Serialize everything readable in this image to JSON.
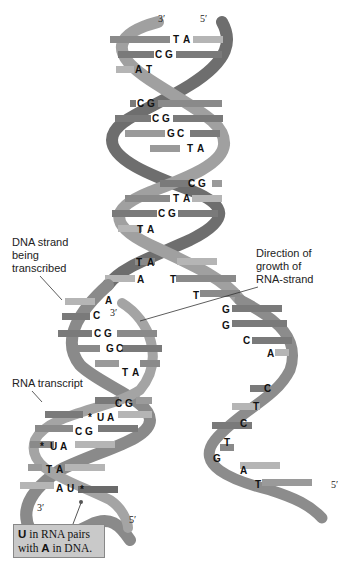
{
  "diagram": {
    "colors": {
      "strand_dark": "#6e6e6e",
      "strand_mid": "#8c8c8c",
      "strand_light": "#a8a8a8",
      "rung_dark": "#7a7a7a",
      "rung_light": "#b2b2b2",
      "callout_bg": "#c9c9c9",
      "text": "#111111"
    },
    "end_labels": {
      "top_left": "3′",
      "top_right": "5′",
      "transcription_3prime": "3′",
      "bottom_left_3prime": "3′",
      "bottom_rna_5prime": "5′",
      "bottom_right_5prime": "5′"
    },
    "labels": {
      "dna_strand_line1": "DNA strand",
      "dna_strand_line2": "being",
      "dna_strand_line3": "transcribed",
      "direction_line1": "Direction of",
      "direction_line2": "growth of",
      "direction_line3": "RNA-strand",
      "rna_transcript": "RNA transcript"
    },
    "double_helix_pairs": [
      {
        "left": "T",
        "right": "A"
      },
      {
        "left": "C",
        "right": "G"
      },
      {
        "left": "A",
        "right": "T"
      },
      {
        "left": "C",
        "right": "G"
      },
      {
        "left": "C",
        "right": "G"
      },
      {
        "left": "G",
        "right": "C"
      },
      {
        "left": "T",
        "right": "A"
      },
      {
        "left": "C",
        "right": "G"
      },
      {
        "left": "T",
        "right": "A"
      },
      {
        "left": "C",
        "right": "G"
      },
      {
        "left": "T",
        "right": "A"
      },
      {
        "left": "T",
        "right": "A"
      }
    ],
    "bubble_template_bases": [
      "A",
      "A",
      "C"
    ],
    "bubble_coding_bases": [
      "T",
      "T",
      "G",
      "G",
      "C",
      "A",
      "C",
      "T",
      "C",
      "T",
      "G",
      "A",
      "T"
    ],
    "rna_dna_hybrid_pairs": [
      {
        "dna": "C",
        "rna": "G"
      },
      {
        "dna": "G",
        "rna": "C"
      },
      {
        "dna": "T",
        "rna": "A"
      },
      {
        "dna": "C",
        "rna": "G"
      },
      {
        "dna": "U",
        "rna": "A",
        "marked": true
      },
      {
        "dna": "C",
        "rna": "G"
      },
      {
        "dna": "U",
        "rna": "A",
        "marked": true
      },
      {
        "dna": "T",
        "rna": "A"
      },
      {
        "dna": "A",
        "rna": "U",
        "marked": true
      }
    ],
    "marker_symbol": "*",
    "callout": {
      "bold1": "U",
      "text1": " in RNA pairs",
      "text2": "with ",
      "bold2": "A",
      "text3": " in DNA."
    }
  }
}
